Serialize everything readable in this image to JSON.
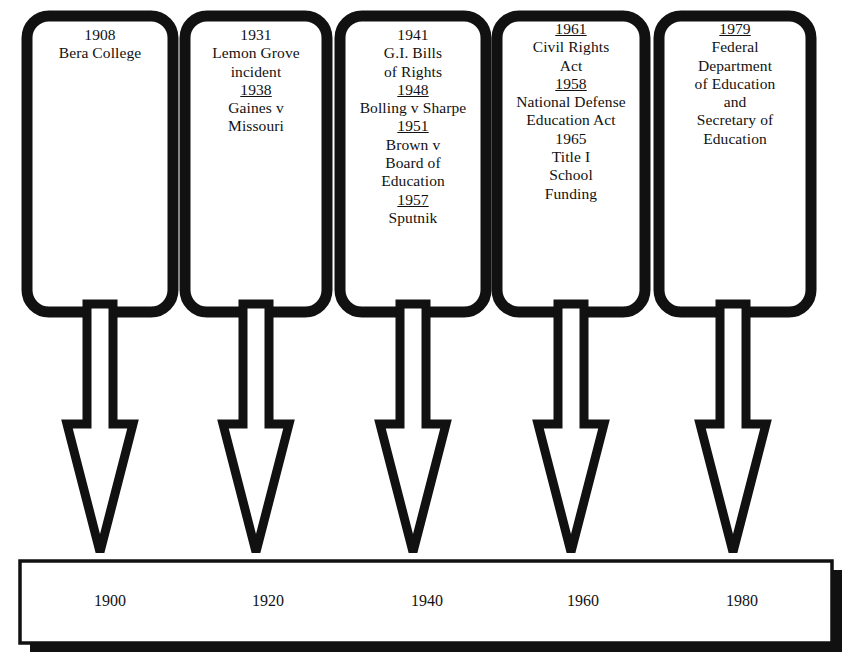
{
  "document": {
    "title": "History of Federal Involvement in Education Timeline",
    "type": "timeline-diagram",
    "background_color": "#ffffff",
    "ink_color": "#111111"
  },
  "timeline": {
    "axis": {
      "name": "decade-axis",
      "ticks": [
        "1900",
        "1920",
        "1940",
        "1960",
        "1980"
      ],
      "bar_fill": "#ffffff",
      "bar_outline": "#111111",
      "bar_shadow": "#111111"
    },
    "arrow": {
      "name": "down-arrow",
      "fill": "#ffffff",
      "outline": "#111111",
      "count": 5
    },
    "boxes": [
      {
        "name": "event-box-1",
        "entries": [
          {
            "year": "1908",
            "underlined": false,
            "lines": [
              "Bera College"
            ]
          }
        ]
      },
      {
        "name": "event-box-2",
        "entries": [
          {
            "year": "1931",
            "underlined": false,
            "lines": [
              "Lemon Grove",
              "incident"
            ]
          },
          {
            "year": "1938",
            "underlined": true,
            "lines": [
              "Gaines v",
              "Missouri"
            ]
          }
        ]
      },
      {
        "name": "event-box-3",
        "entries": [
          {
            "year": "1941",
            "underlined": false,
            "lines": [
              "G.I. Bills",
              "of Rights"
            ]
          },
          {
            "year": "1948",
            "underlined": true,
            "lines": [
              "Bolling v Sharpe"
            ]
          },
          {
            "year": "1951",
            "underlined": true,
            "lines": [
              "Brown v",
              "Board of",
              "Education"
            ]
          },
          {
            "year": "1957",
            "underlined": true,
            "lines": [
              "Sputnik"
            ]
          }
        ]
      },
      {
        "name": "event-box-4",
        "entries": [
          {
            "year": "1961",
            "underlined": true,
            "lines": [
              "Civil Rights",
              "Act"
            ]
          },
          {
            "year": "1958",
            "underlined": true,
            "lines": [
              "National Defense",
              "Education Act"
            ]
          },
          {
            "year": "1965",
            "underlined": false,
            "lines": [
              "Title I",
              "School",
              "Funding"
            ]
          }
        ]
      },
      {
        "name": "event-box-5",
        "entries": [
          {
            "year": "1979",
            "underlined": true,
            "lines": [
              "Federal",
              "Department",
              "of Education",
              "and",
              "Secretary of",
              "Education"
            ]
          }
        ]
      }
    ]
  },
  "caption": {
    "text": ""
  }
}
